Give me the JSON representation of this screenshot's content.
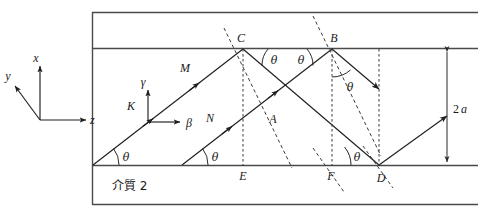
{
  "figure": {
    "medium_label": "介質 2",
    "thickness_label_prefix": "2",
    "thickness_label_symbol": "a",
    "angle_symbol": "θ",
    "colors": {
      "ink": "#1f1f1f",
      "frame": "#4a4a4a",
      "dashed": "#3a3a3a",
      "background": "#ffffff"
    },
    "global_axes": {
      "x_label": "x",
      "y_label": "y",
      "z_label": "z"
    },
    "local_axes": {
      "gamma_label": "γ",
      "beta_label": "β"
    },
    "points": [
      {
        "name": "C",
        "label": "C"
      },
      {
        "name": "B",
        "label": "B"
      },
      {
        "name": "E",
        "label": "E"
      },
      {
        "name": "F",
        "label": "F"
      },
      {
        "name": "D",
        "label": "D"
      }
    ],
    "ray_labels": [
      {
        "name": "K",
        "label": "K"
      },
      {
        "name": "M",
        "label": "M"
      },
      {
        "name": "N",
        "label": "N"
      },
      {
        "name": "A",
        "label": "A"
      }
    ],
    "angle_labels": [
      {
        "name": "theta-origin",
        "label": "θ"
      },
      {
        "name": "theta-lower-left",
        "label": "θ"
      },
      {
        "name": "theta-c-right",
        "label": "θ"
      },
      {
        "name": "theta-b-left",
        "label": "θ"
      },
      {
        "name": "theta-b-lower",
        "label": "θ"
      },
      {
        "name": "theta-d",
        "label": "θ"
      }
    ]
  }
}
